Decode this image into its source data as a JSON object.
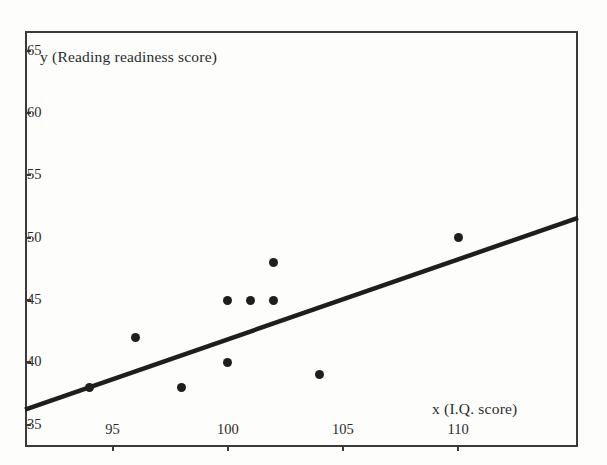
{
  "figure": {
    "background_color": "#fdfdfc",
    "ink_color": "#2b2b2b",
    "point_color": "#1e1e1e",
    "frame_color": "#3a3a3a"
  },
  "chart_data": {
    "type": "scatter",
    "title": "",
    "xlabel": "x (I.Q. score)",
    "ylabel": "y (Reading readiness score)",
    "xlim": [
      91.2,
      115.2
    ],
    "ylim": [
      33.2,
      66.6
    ],
    "xticks": [
      95,
      100,
      105,
      110
    ],
    "xtick_labels": [
      "95",
      "100",
      "105",
      "110"
    ],
    "yticks": [
      35,
      40,
      45,
      50,
      55,
      60,
      65
    ],
    "ytick_labels": [
      "35",
      "40",
      "45",
      "50",
      "55",
      "60",
      "65"
    ],
    "grid": false,
    "legend": null,
    "points": [
      {
        "x": 94,
        "y": 38
      },
      {
        "x": 96,
        "y": 42
      },
      {
        "x": 98,
        "y": 38
      },
      {
        "x": 100,
        "y": 40
      },
      {
        "x": 100,
        "y": 45
      },
      {
        "x": 101,
        "y": 45
      },
      {
        "x": 102,
        "y": 45
      },
      {
        "x": 102,
        "y": 48
      },
      {
        "x": 104,
        "y": 39
      },
      {
        "x": 110,
        "y": 50
      }
    ],
    "series": [
      {
        "name": "Regression line",
        "type": "line",
        "endpoints": [
          {
            "x": 91.2,
            "y": 36.2
          },
          {
            "x": 115.2,
            "y": 51.6
          }
        ]
      }
    ]
  }
}
